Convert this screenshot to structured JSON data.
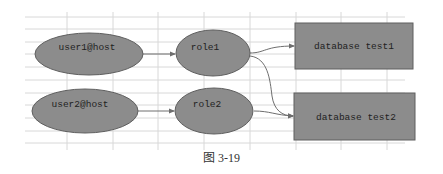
{
  "diagram": {
    "colors": {
      "background": "#ffffff",
      "grid": "#d8d8d8",
      "node_fill": "#8c8c8c",
      "node_stroke": "#5f5f5f",
      "edge": "#6e6e6e",
      "text": "#222222"
    },
    "nodes": [
      {
        "id": "user1",
        "label": "user1@host",
        "shape": "ellipse"
      },
      {
        "id": "role1",
        "label": "role1",
        "shape": "ellipse"
      },
      {
        "id": "db1",
        "label": "database test1",
        "shape": "rectangle"
      },
      {
        "id": "user2",
        "label": "user2@host",
        "shape": "ellipse"
      },
      {
        "id": "role2",
        "label": "role2",
        "shape": "ellipse"
      },
      {
        "id": "db2",
        "label": "database test2",
        "shape": "rectangle"
      }
    ],
    "edges": [
      {
        "from": "user1",
        "to": "role1"
      },
      {
        "from": "role1",
        "to": "db1"
      },
      {
        "from": "role1",
        "to": "db2"
      },
      {
        "from": "user2",
        "to": "role2"
      },
      {
        "from": "role2",
        "to": "db2"
      }
    ]
  },
  "caption": "图 3-19"
}
